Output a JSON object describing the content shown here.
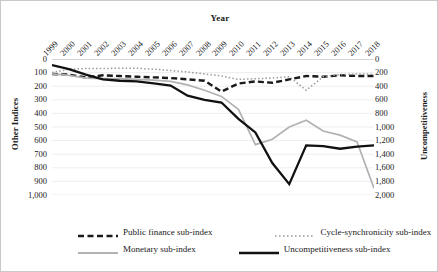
{
  "chart_data": {
    "type": "line",
    "title": "Year",
    "xlabel": "Year",
    "ylabel": "Other Indices",
    "ylabel_secondary": "Uncompetitiveness",
    "grid": true,
    "legend_position": "bottom",
    "y_inverted": true,
    "ylim": [
      0,
      1000
    ],
    "ylim_secondary": [
      0,
      2000
    ],
    "categories": [
      "1999",
      "2000",
      "2001",
      "2002",
      "2003",
      "2004",
      "2005",
      "2006",
      "2007",
      "2008",
      "2009",
      "2010",
      "2011",
      "2012",
      "2013",
      "2014",
      "2015",
      "2016",
      "2017",
      "2018"
    ],
    "yticks": [
      "0",
      "100",
      "200",
      "300",
      "400",
      "500",
      "600",
      "700",
      "800",
      "900",
      "1,000"
    ],
    "yticks_secondary": [
      "0",
      "200",
      "400",
      "600",
      "800",
      "1,000",
      "1,200",
      "1,400",
      "1,600",
      "1,800",
      "2,000"
    ],
    "series": [
      {
        "name": "Public finance sub-index",
        "axis": "left",
        "style": "dashed",
        "color": "#1a1a1a",
        "values": [
          110,
          115,
          135,
          120,
          125,
          130,
          135,
          140,
          150,
          160,
          240,
          180,
          165,
          175,
          150,
          125,
          130,
          120,
          125,
          125
        ]
      },
      {
        "name": "Cycle-synchronicity sub-index",
        "axis": "left",
        "style": "dotted",
        "color": "#9a9a9a",
        "values": [
          100,
          75,
          70,
          70,
          68,
          68,
          75,
          85,
          95,
          110,
          125,
          150,
          145,
          140,
          130,
          230,
          130,
          115,
          110,
          112
        ]
      },
      {
        "name": "Monetary sub-index",
        "axis": "left",
        "style": "solid-gray",
        "color": "#b2b2b2",
        "values": [
          110,
          120,
          140,
          145,
          145,
          150,
          155,
          165,
          190,
          230,
          275,
          370,
          630,
          590,
          500,
          450,
          530,
          560,
          610,
          950
        ]
      },
      {
        "name": "Uncompetitiveness sub-index",
        "axis": "right",
        "style": "solid-black",
        "color": "#111111",
        "values": [
          90,
          150,
          230,
          300,
          320,
          330,
          360,
          390,
          540,
          600,
          640,
          880,
          1080,
          1530,
          1840,
          1270,
          1280,
          1320,
          1290,
          1270
        ],
        "values_left_scale": [
          45,
          75,
          115,
          150,
          160,
          165,
          180,
          195,
          270,
          300,
          320,
          440,
          540,
          765,
          920,
          635,
          640,
          660,
          645,
          635
        ]
      }
    ]
  },
  "legend": {
    "items": [
      {
        "label": "Public finance sub-index"
      },
      {
        "label": "Cycle-synchronicity sub-index"
      },
      {
        "label": "Monetary sub-index"
      },
      {
        "label": "Uncompetitiveness sub-index"
      }
    ]
  }
}
